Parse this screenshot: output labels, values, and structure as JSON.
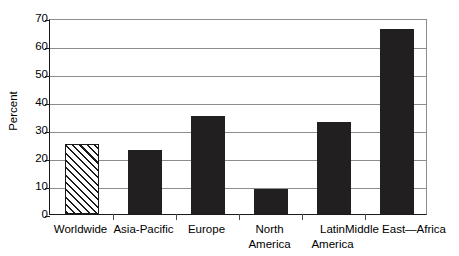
{
  "chart_data": {
    "type": "bar",
    "title": "",
    "subtitle": "",
    "xlabel": "",
    "ylabel": "Percent",
    "ylim": [
      0,
      70
    ],
    "ytick_step": 10,
    "yticks": [
      "0",
      "10",
      "20",
      "30",
      "40",
      "50",
      "60",
      "70"
    ],
    "grid": true,
    "grid_axis": "y",
    "legend": false,
    "legend_position": "none",
    "categories": [
      "Worldwide",
      "Asia-Pacific",
      "Europe",
      "North America",
      "Latin America",
      "Middle East—Africa"
    ],
    "category_lines": [
      [
        "Worldwide"
      ],
      [
        "Asia-Pacific"
      ],
      [
        "Europe"
      ],
      [
        "North",
        "America"
      ],
      [
        "Latin",
        "America"
      ],
      [
        "Middle East—Africa"
      ]
    ],
    "values": [
      25,
      23,
      35,
      9,
      33,
      66
    ],
    "bar_styles": [
      "hatched",
      "solid",
      "solid",
      "solid",
      "solid",
      "solid"
    ],
    "colors": {
      "bar_fill": "#221f20",
      "hatch_line": "#1a1a1a",
      "hatch_background": "#ffffff",
      "axis": "#1a1a1a",
      "gridline": "#8c8c8c",
      "text": "#000000",
      "plot_background": "#ffffff"
    },
    "annotations": []
  }
}
